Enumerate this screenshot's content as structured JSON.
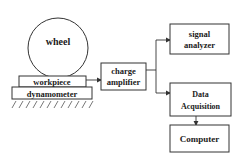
{
  "diagram": {
    "wheel": {
      "label": "wheel"
    },
    "workpiece": {
      "label": "workpiece"
    },
    "dynamometer": {
      "label": "dynamometer"
    },
    "charge_amplifier": {
      "line1": "charge",
      "line2": "amplifier"
    },
    "signal_analyzer": {
      "line1": "signal",
      "line2": "analyzer"
    },
    "data_acquisition": {
      "line1": "Data",
      "line2": "Acquisition"
    },
    "computer": {
      "label": "Computer"
    },
    "colors": {
      "stroke": "#333333",
      "text": "#1a1a1a",
      "background": "#ffffff"
    }
  }
}
